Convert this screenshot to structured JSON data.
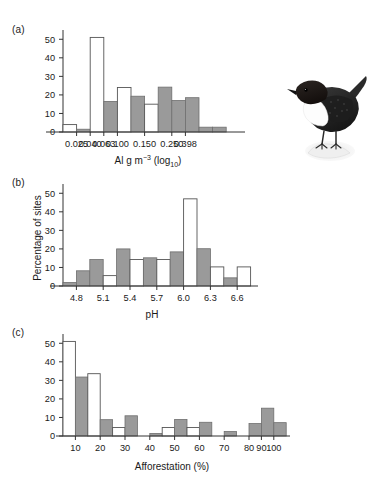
{
  "figure": {
    "background": "#ffffff",
    "solid_bar_color": "#9a9a9a",
    "open_bar_color": "#ffffff",
    "axis_color": "#333333",
    "shared_ylabel": "Percentage of sites",
    "ylim": [
      0,
      55
    ],
    "yticks": [
      0,
      10,
      20,
      30,
      40,
      50
    ]
  },
  "panels": {
    "a": {
      "label": "(a)",
      "xlabel_main": "Al g m",
      "xlabel_sup": "−3",
      "xlabel_tail": " (log",
      "xlabel_sub": "10",
      "xlabel_end": ")",
      "xlabel_plain": "Al g m−3 (log10)",
      "ylabel": "",
      "xticklabels": [
        "0.025",
        "0.040",
        "0.063",
        "0.100",
        "0.150",
        "0.250",
        "0.398"
      ]
    },
    "b": {
      "label": "(b)",
      "xlabel_plain": "pH",
      "ylabel": "Percentage of sites",
      "xticklabels": [
        "4.8",
        "5.1",
        "5.4",
        "5.7",
        "6.0",
        "6.3",
        "6.6"
      ]
    },
    "c": {
      "label": "(c)",
      "xlabel_plain": "Afforestation (%)",
      "ylabel": "",
      "xticklabels": [
        "10",
        "20",
        "30",
        "40",
        "50",
        "60",
        "70",
        "80",
        "90",
        "100"
      ]
    }
  },
  "illustration": {
    "name": "white-throated-dipper-bird",
    "caption": ""
  },
  "chart_data": [
    {
      "id": "panel-a",
      "type": "bar",
      "title": "(a)",
      "xlabel": "Al g m−3 (log10)",
      "ylabel": "Percentage of sites",
      "ylim": [
        0,
        55
      ],
      "yticks": [
        0,
        10,
        20,
        30,
        40,
        50
      ],
      "grid": false,
      "legend": [
        "open (historic)",
        "solid (current)"
      ],
      "tick_values": [
        0.025,
        0.04,
        0.063,
        0.1,
        0.15,
        0.25,
        0.398
      ],
      "tick_labels": [
        "0.025",
        "0.040",
        "0.063",
        "0.100",
        "0.150",
        "0.250",
        "0.398"
      ],
      "bins": [
        {
          "slot": 0,
          "style": "open",
          "value": 4.0
        },
        {
          "slot": 1,
          "style": "solid",
          "value": 1.5
        },
        {
          "slot": 2,
          "style": "open",
          "value": 51.0
        },
        {
          "slot": 3,
          "style": "solid",
          "value": 16.5
        },
        {
          "slot": 4,
          "style": "open",
          "value": 24.0
        },
        {
          "slot": 5,
          "style": "solid",
          "value": 19.3
        },
        {
          "slot": 6,
          "style": "open",
          "value": 15.0
        },
        {
          "slot": 7,
          "style": "solid",
          "value": 24.2
        },
        {
          "slot": 8,
          "style": "solid",
          "value": 17.0
        },
        {
          "slot": 9,
          "style": "solid",
          "value": 18.5
        },
        {
          "slot": 10,
          "style": "solid",
          "value": 2.6
        },
        {
          "slot": 11,
          "style": "solid",
          "value": 2.6
        }
      ]
    },
    {
      "id": "panel-b",
      "type": "bar",
      "title": "(b)",
      "xlabel": "pH",
      "ylabel": "Percentage of sites",
      "ylim": [
        0,
        55
      ],
      "yticks": [
        0,
        10,
        20,
        30,
        40,
        50
      ],
      "grid": false,
      "legend": [
        "open (historic)",
        "solid (current)"
      ],
      "tick_values": [
        4.8,
        5.1,
        5.4,
        5.7,
        6.0,
        6.3,
        6.6
      ],
      "tick_labels": [
        "4.8",
        "5.1",
        "5.4",
        "5.7",
        "6.0",
        "6.3",
        "6.6"
      ],
      "bins": [
        {
          "slot": 0,
          "style": "solid",
          "value": 1.9
        },
        {
          "slot": 1,
          "style": "solid",
          "value": 8.2
        },
        {
          "slot": 2,
          "style": "solid",
          "value": 14.3
        },
        {
          "slot": 3,
          "style": "open",
          "value": 5.6
        },
        {
          "slot": 4,
          "style": "solid",
          "value": 20.0
        },
        {
          "slot": 5,
          "style": "open",
          "value": 14.3
        },
        {
          "slot": 6,
          "style": "solid",
          "value": 15.2
        },
        {
          "slot": 7,
          "style": "open",
          "value": 14.3
        },
        {
          "slot": 8,
          "style": "solid",
          "value": 18.4
        },
        {
          "slot": 9,
          "style": "open",
          "value": 47.0
        },
        {
          "slot": 10,
          "style": "solid",
          "value": 20.1
        },
        {
          "slot": 11,
          "style": "open",
          "value": 10.3
        },
        {
          "slot": 12,
          "style": "solid",
          "value": 4.4
        },
        {
          "slot": 13,
          "style": "open",
          "value": 10.3
        }
      ]
    },
    {
      "id": "panel-c",
      "type": "bar",
      "title": "(c)",
      "xlabel": "Afforestation (%)",
      "ylabel": "Percentage of sites",
      "ylim": [
        0,
        55
      ],
      "yticks": [
        0,
        10,
        20,
        30,
        40,
        50
      ],
      "grid": false,
      "legend": [
        "open (historic)",
        "solid (current)"
      ],
      "tick_values": [
        10,
        20,
        30,
        40,
        50,
        60,
        70,
        80,
        90,
        100
      ],
      "tick_labels": [
        "10",
        "20",
        "30",
        "40",
        "50",
        "60",
        "70",
        "80",
        "90",
        "100"
      ],
      "bins": [
        {
          "slot": 0,
          "style": "open",
          "value": 51.0
        },
        {
          "slot": 1,
          "style": "solid",
          "value": 31.8
        },
        {
          "slot": 2,
          "style": "open",
          "value": 33.6
        },
        {
          "slot": 3,
          "style": "solid",
          "value": 8.8
        },
        {
          "slot": 4,
          "style": "open",
          "value": 4.6
        },
        {
          "slot": 5,
          "style": "solid",
          "value": 10.9
        },
        {
          "slot": 6,
          "style": "open",
          "value": 0.0
        },
        {
          "slot": 7,
          "style": "solid",
          "value": 1.4
        },
        {
          "slot": 8,
          "style": "open",
          "value": 4.6
        },
        {
          "slot": 9,
          "style": "solid",
          "value": 8.9
        },
        {
          "slot": 10,
          "style": "open",
          "value": 4.6
        },
        {
          "slot": 11,
          "style": "solid",
          "value": 7.4
        },
        {
          "slot": 12,
          "style": "open",
          "value": 0.0
        },
        {
          "slot": 13,
          "style": "solid",
          "value": 2.4
        },
        {
          "slot": 14,
          "style": "open",
          "value": 0.0
        },
        {
          "slot": 15,
          "style": "solid",
          "value": 6.7
        },
        {
          "slot": 16,
          "style": "solid",
          "value": 15.0
        },
        {
          "slot": 17,
          "style": "solid",
          "value": 7.2
        }
      ]
    }
  ]
}
